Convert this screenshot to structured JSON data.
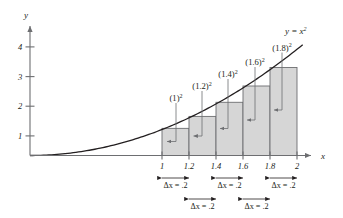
{
  "figure": {
    "curve_label": "y = x",
    "curve_label_sup": "2",
    "x_axis_label": "x",
    "y_axis_label": "y"
  },
  "axes": {
    "y_ticks": [
      {
        "label": "1",
        "value": 1
      },
      {
        "label": "2",
        "value": 2
      },
      {
        "label": "3",
        "value": 3
      },
      {
        "label": "4",
        "value": 4
      }
    ],
    "x_ticks": [
      {
        "label": "1",
        "value": 1.0
      },
      {
        "label": "1.2",
        "value": 1.2
      },
      {
        "label": "1.4",
        "value": 1.4
      },
      {
        "label": "1.6",
        "value": 1.6
      },
      {
        "label": "1.8",
        "value": 1.8
      },
      {
        "label": "2",
        "value": 2.0
      }
    ]
  },
  "bars": [
    {
      "label_base": "(1)",
      "label_sup": "2",
      "x_left": 1.0,
      "x_right": 1.2,
      "height": 1.0
    },
    {
      "label_base": "(1.2)",
      "label_sup": "2",
      "x_left": 1.2,
      "x_right": 1.4,
      "height": 1.44
    },
    {
      "label_base": "(1.4)",
      "label_sup": "2",
      "x_left": 1.4,
      "x_right": 1.6,
      "height": 1.96
    },
    {
      "label_base": "(1.6)",
      "label_sup": "2",
      "x_left": 1.6,
      "x_right": 1.8,
      "height": 2.56
    },
    {
      "label_base": "(1.8)",
      "label_sup": "2",
      "x_left": 1.8,
      "x_right": 2.0,
      "height": 3.24
    }
  ],
  "brackets_row1": [
    {
      "label": "Δx = .2",
      "from": 1.0,
      "to": 1.2
    },
    {
      "label": "Δx = .2",
      "from": 1.4,
      "to": 1.6
    },
    {
      "label": "Δx = .2",
      "from": 1.8,
      "to": 2.0
    }
  ],
  "brackets_row2": [
    {
      "label": "Δx = .2",
      "from": 1.2,
      "to": 1.4
    },
    {
      "label": "Δx = .2",
      "from": 1.6,
      "to": 1.8
    }
  ],
  "colors": {
    "bar_fill": "#d6d6d6",
    "bar_stroke": "#6d6e71",
    "axis": "#6d6e71",
    "curve": "#231f20",
    "text": "#231f20"
  },
  "chart_data": {
    "type": "area",
    "xlabel": "x",
    "ylabel": "y",
    "xlim": [
      0,
      2.2
    ],
    "ylim": [
      0,
      4.6
    ],
    "grid": false,
    "legend": "none",
    "function": "y = x^2",
    "curve_label": "y = x^2",
    "x_tick_labels": [
      "1",
      "1.2",
      "1.4",
      "1.6",
      "1.8",
      "2"
    ],
    "x_tick_values": [
      1.0,
      1.2,
      1.4,
      1.6,
      1.8,
      2.0
    ],
    "y_tick_labels": [
      "1",
      "2",
      "3",
      "4"
    ],
    "y_tick_values": [
      1,
      2,
      3,
      4
    ],
    "delta_x": 0.2,
    "rule": "right endpoint",
    "rectangles": [
      {
        "x_left": 1.0,
        "x_right": 1.2,
        "height": 1.0,
        "annotation": "(1)²"
      },
      {
        "x_left": 1.2,
        "x_right": 1.4,
        "height": 1.44,
        "annotation": "(1.2)²"
      },
      {
        "x_left": 1.4,
        "x_right": 1.6,
        "height": 1.96,
        "annotation": "(1.4)²"
      },
      {
        "x_left": 1.6,
        "x_right": 1.8,
        "height": 2.56,
        "annotation": "(1.6)²"
      },
      {
        "x_left": 1.8,
        "x_right": 2.0,
        "height": 3.24,
        "annotation": "(1.8)²"
      }
    ],
    "annotations": [
      "Δx = .2",
      "Δx = .2",
      "Δx = .2",
      "Δx = .2",
      "Δx = .2",
      "y = x²"
    ]
  }
}
